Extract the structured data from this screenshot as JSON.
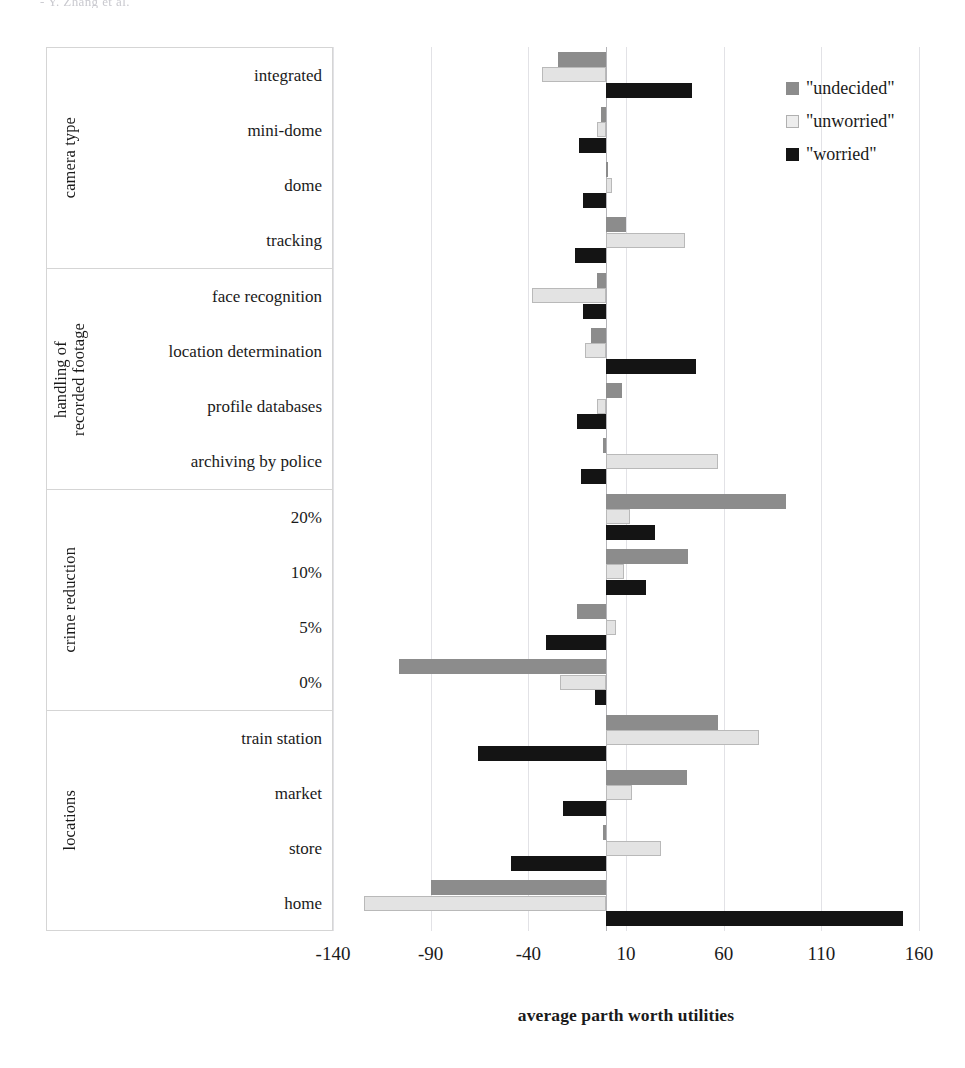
{
  "page": {
    "running_head": "-  Y. Zhang et al."
  },
  "legend": {
    "position": "top-right",
    "items": [
      {
        "label": "\"undecided\"",
        "color": "#8c8c8c",
        "key": "undecided"
      },
      {
        "label": "\"unworried\"",
        "color": "#ededed",
        "key": "unworried"
      },
      {
        "label": "\"worried\"",
        "color": "#141414",
        "key": "worried"
      }
    ]
  },
  "axis": {
    "title": "average parth worth utilities",
    "ticks": [
      "-140",
      "-90",
      "-40",
      "10",
      "60",
      "110",
      "160"
    ],
    "tick_values": [
      -140,
      -90,
      -40,
      10,
      60,
      110,
      160
    ],
    "min": -140,
    "max": 160
  },
  "groups": [
    {
      "title": "camera type",
      "categories": [
        "integrated",
        "mini-dome",
        "dome",
        "tracking"
      ]
    },
    {
      "title": "handling of\nrecorded footage",
      "categories": [
        "face recognition",
        "location determination",
        "profile databases",
        "archiving by police"
      ]
    },
    {
      "title": "crime reduction",
      "categories": [
        "20%",
        "10%",
        "5%",
        "0%"
      ]
    },
    {
      "title": "locations",
      "categories": [
        "train station",
        "market",
        "store",
        "home"
      ]
    }
  ],
  "chart_data": {
    "type": "bar",
    "orientation": "horizontal",
    "title": "",
    "xlabel": "average parth worth utilities",
    "ylabel": "",
    "xlim": [
      -140,
      160
    ],
    "grid": true,
    "legend_position": "top-right",
    "categories": [
      "integrated",
      "mini-dome",
      "dome",
      "tracking",
      "face recognition",
      "location determination",
      "profile databases",
      "archiving by police",
      "20%",
      "10%",
      "5%",
      "0%",
      "train station",
      "market",
      "store",
      "home"
    ],
    "series": [
      {
        "name": "\"undecided\"",
        "color": "#8c8c8c",
        "values": [
          -25,
          -3,
          1,
          10,
          -5,
          -8,
          8,
          -2,
          92,
          42,
          -15,
          -106,
          57,
          41,
          -2,
          -90
        ]
      },
      {
        "name": "\"unworried\"",
        "color": "#ededed",
        "values": [
          -33,
          -5,
          3,
          40,
          -38,
          -11,
          -5,
          57,
          12,
          9,
          5,
          -24,
          78,
          13,
          28,
          -124
        ]
      },
      {
        "name": "\"worried\"",
        "color": "#141414",
        "values": [
          44,
          -14,
          -12,
          -16,
          -12,
          46,
          -15,
          -13,
          25,
          20,
          -31,
          -6,
          -66,
          -22,
          -49,
          152
        ]
      }
    ]
  }
}
